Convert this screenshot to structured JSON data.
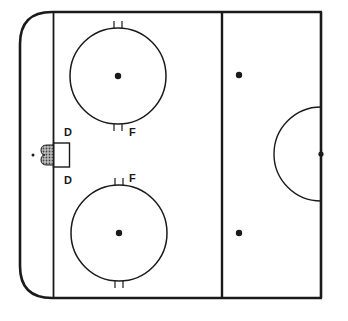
{
  "diagram": {
    "type": "hockey-rink-half",
    "colors": {
      "background": "#ffffff",
      "line": "#1a1a1a",
      "net_fill": "#9a9a9a"
    },
    "labels": {
      "d_top": "D",
      "f_top": "F",
      "d_bottom": "D",
      "f_bottom": "F"
    },
    "elements": {
      "boards": "rink boards",
      "goal_line": "goal line",
      "blue_line": "blue line",
      "center_line": "center red line",
      "top_faceoff_circle": "top faceoff circle",
      "bottom_faceoff_circle": "bottom faceoff circle",
      "neutral_zone_dots": [
        "top neutral zone faceoff dot",
        "bottom neutral zone faceoff dot"
      ],
      "center_circle": "center faceoff half-circle",
      "goal_crease": "goal crease",
      "net": "goal net"
    }
  }
}
